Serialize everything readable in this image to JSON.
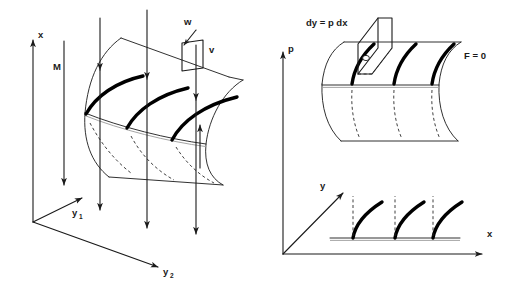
{
  "figure": {
    "background_color": "#ffffff",
    "ink_color": "#1a1a1a",
    "bold_curve_color": "#000000",
    "dashed_color": "#2a2a2a"
  },
  "left_panel": {
    "name": "three-dimensional characteristic surface",
    "axes": {
      "vertical": {
        "label": "x",
        "direction": "up"
      },
      "diagonal_near": {
        "label": "y",
        "subscript": "1",
        "direction": "up-right"
      },
      "diagonal_far": {
        "label": "y",
        "subscript": "2",
        "direction": "right-down"
      }
    },
    "labels": {
      "moment": "M",
      "w": "w",
      "v": "v"
    },
    "bold_characteristic_curves": 3,
    "downward_arrows": 4,
    "upward_arrows": 1,
    "dashed_hidden_curves": 3
  },
  "right_panel_top": {
    "name": "characteristic cylinder surface",
    "axis": {
      "label": "p",
      "direction": "up"
    },
    "labels": {
      "element": "dy = p dx",
      "condition": "F = 0"
    },
    "bold_characteristic_curves": 3,
    "dashed_hidden_curves": 3,
    "has_tangent_element_parallelogram": true
  },
  "right_panel_bottom": {
    "name": "projection onto x-y plane",
    "axes": {
      "horizontal": {
        "label": "x",
        "direction": "right"
      },
      "diagonal": {
        "label": "y",
        "direction": "up-right"
      }
    },
    "bold_projected_curves": 3,
    "dashed_verticals": 3
  }
}
